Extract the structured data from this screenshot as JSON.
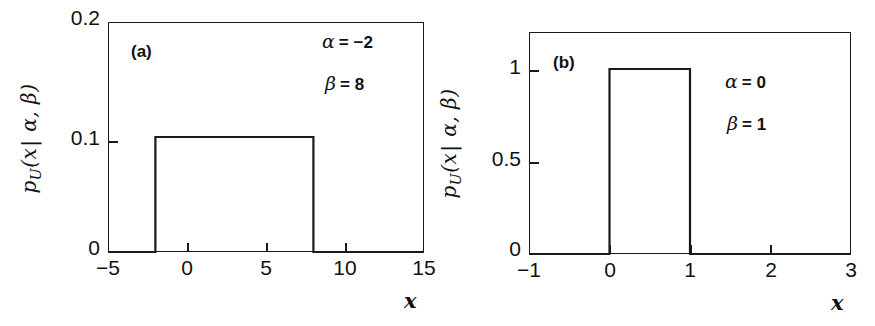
{
  "figure": {
    "panels": [
      {
        "tag": "(a)",
        "y_axis_title_parts": {
          "p": "p",
          "sub": "U",
          "open": "(",
          "x": "x",
          "bar": "|",
          "alpha": "α",
          "comma": ",",
          "beta": "β",
          "close": ")"
        },
        "x_axis_title": "x",
        "annotations": [
          {
            "symbol": "α",
            "eq": "= −2"
          },
          {
            "symbol": "β",
            "eq": "= 8"
          }
        ]
      },
      {
        "tag": "(b)",
        "x_axis_title": "x",
        "annotations": [
          {
            "symbol": "α",
            "eq": "= 0"
          },
          {
            "symbol": "β",
            "eq": "= 1"
          }
        ]
      }
    ]
  },
  "chart_data": [
    {
      "type": "line",
      "panel": "(a)",
      "title": "",
      "xlabel": "x",
      "ylabel": "p_U(x| α, β)",
      "xlim": [
        -5,
        15
      ],
      "ylim": [
        0,
        0.2
      ],
      "xticks": [
        -5,
        0,
        5,
        10,
        15
      ],
      "xticklabels": [
        "−5",
        "0",
        "5",
        "10",
        "15"
      ],
      "yticks": [
        0,
        0.1,
        0.2
      ],
      "yticklabels": [
        "0",
        "0.1",
        "0.2"
      ],
      "grid": false,
      "legend": false,
      "annotations": [
        "α = −2",
        "β = 8",
        "(a)"
      ],
      "description": "Uniform probability density on the interval [-2, 8]; density value 0.1 inside, 0 outside.",
      "parameters": {
        "alpha": -2,
        "beta": 8,
        "density": 0.1
      },
      "series": [
        {
          "name": "uniform pdf",
          "x": [
            -5,
            -2,
            -2,
            8,
            8,
            15
          ],
          "y": [
            0,
            0,
            0.1,
            0.1,
            0,
            0
          ]
        }
      ]
    },
    {
      "type": "line",
      "panel": "(b)",
      "title": "",
      "xlabel": "x",
      "ylabel": "p_U(x| α, β)",
      "xlim": [
        -1,
        3
      ],
      "ylim": [
        0,
        1.2
      ],
      "xticks": [
        -1,
        0,
        1,
        2,
        3
      ],
      "xticklabels": [
        "−1",
        "0",
        "1",
        "2",
        "3"
      ],
      "yticks": [
        0,
        0.5,
        1
      ],
      "yticklabels": [
        "0",
        "0.5",
        "1"
      ],
      "grid": false,
      "legend": false,
      "annotations": [
        "α = 0",
        "β = 1",
        "(b)"
      ],
      "description": "Standard uniform probability density on the interval [0, 1]; density value 1 inside, 0 outside.",
      "parameters": {
        "alpha": 0,
        "beta": 1,
        "density": 1
      },
      "series": [
        {
          "name": "uniform pdf",
          "x": [
            -1,
            0,
            0,
            1,
            1,
            3
          ],
          "y": [
            0,
            0,
            1,
            1,
            0,
            0
          ]
        }
      ]
    }
  ]
}
